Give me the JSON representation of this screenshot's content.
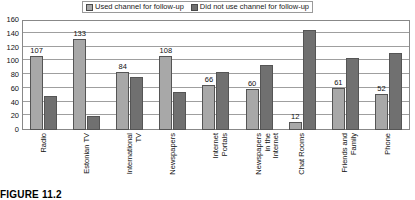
{
  "chart_data": {
    "type": "bar",
    "title": "",
    "xlabel": "",
    "ylabel": "",
    "ylim": [
      0,
      160
    ],
    "ytick_step": 20,
    "yticks": [
      0,
      20,
      40,
      60,
      80,
      100,
      120,
      140,
      160
    ],
    "grid": true,
    "legend_position": "top-center",
    "categories": [
      "Radio",
      "Estonian TV",
      "International\nTV",
      "Newspapers",
      "Internet\nPortals",
      "Newspapers\nin the\nInternet",
      "Chat Rooms",
      "Friends and\nFamily",
      "Phone"
    ],
    "series": [
      {
        "name": "Used channel for follow-up",
        "color": "#a8a8a8",
        "values": [
          107,
          133,
          84,
          108,
          66,
          60,
          12,
          61,
          52
        ],
        "labels": [
          "107",
          "133",
          "84",
          "108",
          "66",
          "60",
          "12",
          "61",
          "52"
        ]
      },
      {
        "name": "Did not use channel for follow-up",
        "color": "#707070",
        "values": [
          50,
          21,
          77,
          56,
          85,
          95,
          145,
          105,
          112
        ],
        "labels": [
          "",
          "",
          "",
          "",
          "",
          "",
          "",
          "",
          ""
        ]
      }
    ]
  },
  "legend": {
    "entries": [
      {
        "label": "Used channel for follow-up"
      },
      {
        "label": "Did not use channel for follow-up"
      }
    ]
  },
  "caption": {
    "text": "FIGURE 11.2"
  },
  "colors": {
    "series_light": "#a8a8a8",
    "series_dark": "#707070",
    "gridline": "#9f9f9f",
    "frame": "#888888",
    "background": "#ffffff"
  }
}
